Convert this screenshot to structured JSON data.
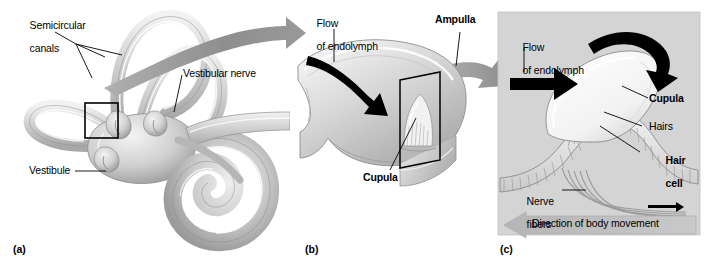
{
  "figure": {
    "background_color": "#ffffff",
    "panel_c_background": "#d6d6d6",
    "ink_color": "#000000",
    "gray_arrow_color": "#9a9a9a",
    "tissue_light": "#e8e8e8",
    "tissue_mid": "#c9c9c9",
    "tissue_dark": "#a0a0a0"
  },
  "panel_a": {
    "tag": "(a)",
    "labels": {
      "semicircular_canals_line1": "Semicircular",
      "semicircular_canals_line2": "canals",
      "vestibular_nerve": "Vestibular nerve",
      "vestibule": "Vestibule"
    },
    "callout_box": "detail-box-ampulla"
  },
  "panel_b": {
    "tag": "(b)",
    "labels": {
      "flow_line1": "Flow",
      "flow_line2": "of endolymph",
      "ampulla": "Ampulla",
      "cupula": "Cupula"
    },
    "callout_box": "detail-box-cupula"
  },
  "panel_c": {
    "tag": "(c)",
    "labels": {
      "flow_line1": "Flow",
      "flow_line2": "of endolymph",
      "cupula": "Cupula",
      "hairs": "Hairs",
      "hair_cell_line1": "Hair",
      "hair_cell_line2": "cell",
      "nerve_fibers_line1": "Nerve",
      "nerve_fibers_line2": "fibers",
      "direction_banner": "Direction of body movement"
    }
  }
}
